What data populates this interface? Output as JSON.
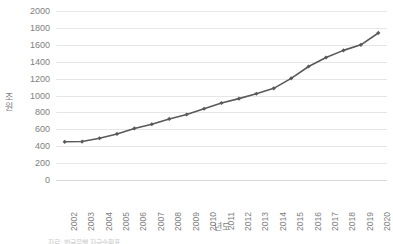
{
  "chart_data": {
    "type": "line",
    "title": "",
    "xlabel": "년도",
    "ylabel": "조원",
    "ylim": [
      0,
      2000
    ],
    "ytick_step": 200,
    "grid": true,
    "legend": null,
    "legend_position": "none",
    "line_color": "#595959",
    "marker": "diamond",
    "marker_color": "#595959",
    "gridline_color": "#e6e6e6",
    "categories": [
      "2002",
      "2003",
      "2004",
      "2005",
      "2006",
      "2007",
      "2008",
      "2009",
      "2010",
      "2011",
      "2012",
      "2013",
      "2014",
      "2015",
      "2016",
      "2017",
      "2018",
      "2019",
      "2020"
    ],
    "yticks": [
      "0",
      "200",
      "400",
      "600",
      "800",
      "1000",
      "1200",
      "1400",
      "1600",
      "1800",
      "2000"
    ],
    "values": [
      452,
      455,
      494,
      545,
      610,
      660,
      723,
      775,
      843,
      911,
      963,
      1021,
      1085,
      1203,
      1343,
      1450,
      1534,
      1600,
      1740
    ],
    "series": [
      {
        "name": "",
        "values": [
          452,
          455,
          494,
          545,
          610,
          660,
          723,
          775,
          843,
          911,
          963,
          1021,
          1085,
          1203,
          1343,
          1450,
          1534,
          1600,
          1740
        ]
      }
    ]
  },
  "footnote": "자료: 한국은행 자금순환표"
}
